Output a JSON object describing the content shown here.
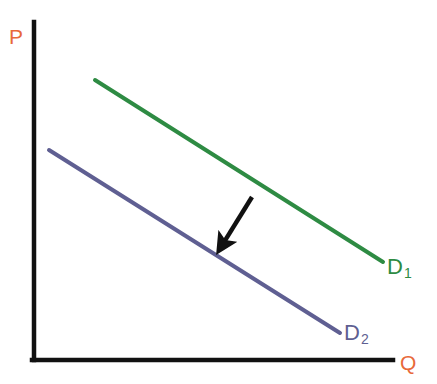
{
  "figure": {
    "background": "#ffffff",
    "width": 437,
    "height": 384
  },
  "axes": {
    "y_axis_label": "P",
    "x_axis_label": "Q",
    "axis_color": "#111111",
    "label_color": "#e8693a",
    "y_axis": {
      "x": 34,
      "y_top": 22,
      "y_bottom": 360
    },
    "x_axis": {
      "y": 360,
      "x_left": 34,
      "x_right": 393
    }
  },
  "curves": [
    {
      "name": "D1",
      "label_main": "D",
      "label_sub": "1",
      "color": "#2e8b43",
      "x1": 95,
      "y1": 80,
      "x2": 383,
      "y2": 262,
      "label_x": 387,
      "label_y": 256
    },
    {
      "name": "D2",
      "label_main": "D",
      "label_sub": "2",
      "color": "#5f5f92",
      "x1": 49,
      "y1": 150,
      "x2": 340,
      "y2": 333,
      "label_x": 344,
      "label_y": 322
    }
  ],
  "annotation": {
    "arrow": {
      "name": "shift-arrow",
      "color": "#111111",
      "from_x": 252,
      "from_y": 197,
      "to_x": 221,
      "to_y": 247,
      "meaning": "leftward-shift-of-demand"
    }
  },
  "chart_data": {
    "type": "line",
    "title": "",
    "xlabel": "Q",
    "ylabel": "P",
    "grid": false,
    "legend": "inline-endpoint-labels",
    "xlim": [
      0,
      100
    ],
    "ylim": [
      0,
      100
    ],
    "series": [
      {
        "name": "D1",
        "label": "D1",
        "color": "#2e8b43",
        "x": [
          17,
          97
        ],
        "y": [
          83,
          29
        ]
      },
      {
        "name": "D2",
        "label": "D2",
        "color": "#5f5f92",
        "x": [
          4,
          85
        ],
        "y": [
          62,
          8
        ]
      }
    ],
    "annotations": [
      {
        "type": "arrow",
        "text": "",
        "x_start": 61,
        "y_start": 48,
        "x_end": 52,
        "y_end": 34,
        "color": "#111111"
      }
    ]
  }
}
